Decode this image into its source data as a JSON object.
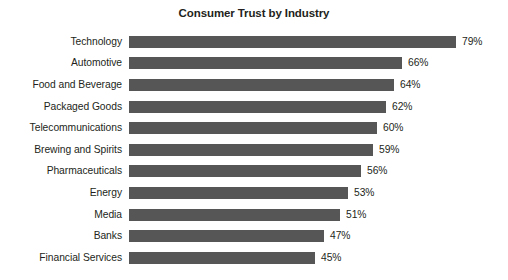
{
  "chart_data": {
    "type": "bar",
    "orientation": "horizontal",
    "title": "Consumer Trust by Industry",
    "xlabel": "",
    "ylabel": "",
    "xlim": [
      0,
      79
    ],
    "grid": false,
    "legend": null,
    "value_suffix": "%",
    "bar_color": "#565656",
    "text_color": "#231f20",
    "background_color": "#ffffff",
    "categories": [
      "Technology",
      "Automotive",
      "Food and Beverage",
      "Packaged Goods",
      "Telecommunications",
      "Brewing and Spirits",
      "Pharmaceuticals",
      "Energy",
      "Media",
      "Banks",
      "Financial Services"
    ],
    "values": [
      79,
      66,
      64,
      62,
      60,
      59,
      56,
      53,
      51,
      47,
      45
    ],
    "data_labels": [
      "79%",
      "66%",
      "64%",
      "62%",
      "60%",
      "59%",
      "56%",
      "53%",
      "51%",
      "47%",
      "45%"
    ]
  }
}
